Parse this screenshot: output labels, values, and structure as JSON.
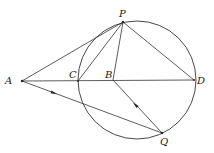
{
  "diagram": {
    "type": "geometry",
    "stroke_color": "#333333",
    "circle": {
      "cx": 137,
      "cy": 80,
      "r": 59
    },
    "points": {
      "A": {
        "label": "A",
        "x": 22,
        "y": 81,
        "lx": 5,
        "ly": 76
      },
      "C": {
        "label": "C",
        "x": 78,
        "y": 81,
        "lx": 68,
        "ly": 70
      },
      "B": {
        "label": "B",
        "x": 113,
        "y": 80,
        "lx": 106,
        "ly": 70
      },
      "D": {
        "label": "D",
        "x": 194,
        "y": 80,
        "lx": 197,
        "ly": 76
      },
      "P": {
        "label": "P",
        "x": 123,
        "y": 22,
        "lx": 119,
        "ly": 9
      },
      "Q": {
        "label": "Q",
        "x": 162,
        "y": 133,
        "lx": 160,
        "ly": 137
      }
    },
    "segments": [
      "AP",
      "AD",
      "AQ",
      "CP",
      "BP",
      "PD",
      "BQ"
    ],
    "arrows": [
      {
        "on": "AQ",
        "x": 54,
        "y": 93,
        "direction": "toward-Q"
      },
      {
        "on": "BQ",
        "x": 136,
        "y": 106,
        "direction": "toward-B"
      }
    ]
  }
}
